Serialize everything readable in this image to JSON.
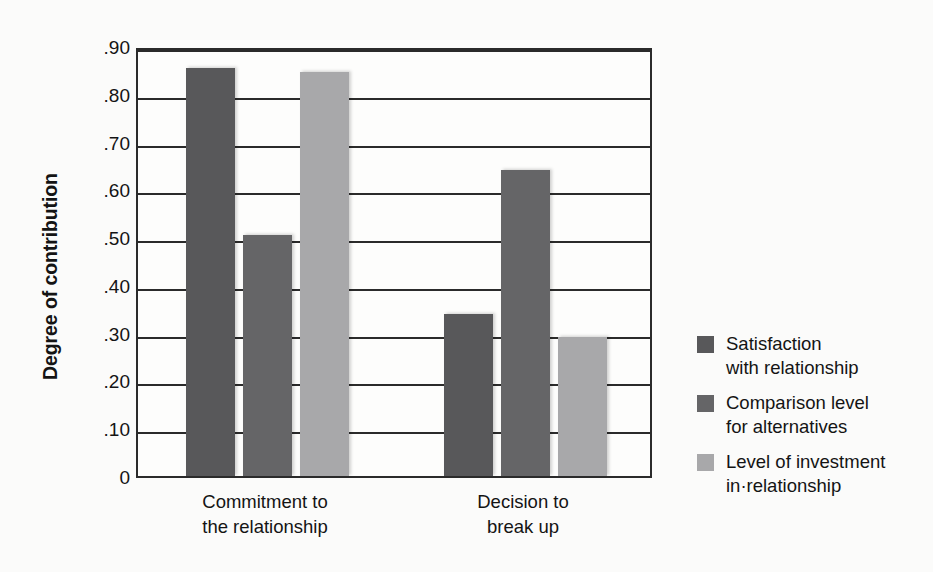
{
  "chart_data": {
    "type": "bar",
    "title": "",
    "xlabel": "",
    "ylabel": "Degree of contribution",
    "categories": [
      "Commitment to\nthe relationship",
      "Decision to\nbreak up"
    ],
    "series": [
      {
        "name": "Satisfaction\nwith relationship",
        "color": "#58585a",
        "values": [
          0.855,
          0.34
        ]
      },
      {
        "name": "Comparison level\nfor alternatives",
        "color": "#656567",
        "values": [
          0.505,
          0.64
        ]
      },
      {
        "name": "Level of investment\nin·relationship",
        "color": "#a8a8aa",
        "values": [
          0.845,
          0.29
        ]
      }
    ],
    "ylim": [
      0,
      0.9
    ],
    "y_ticks": [
      0,
      0.1,
      0.2,
      0.3,
      0.4,
      0.5,
      0.6,
      0.7,
      0.8,
      0.9
    ],
    "y_tick_labels": [
      "0",
      ".10",
      ".20",
      ".30",
      ".40",
      ".50",
      ".60",
      ".70",
      ".80",
      ".90"
    ],
    "grid": true,
    "legend_position": "right"
  },
  "axis": {
    "y_title": "Degree of contribution"
  },
  "legend": {
    "items": [
      {
        "label": "Satisfaction\nwith relationship",
        "color": "#58585a"
      },
      {
        "label": "Comparison level\nfor alternatives",
        "color": "#656567"
      },
      {
        "label": "Level of investment\nin·relationship",
        "color": "#a8a8aa"
      }
    ]
  }
}
